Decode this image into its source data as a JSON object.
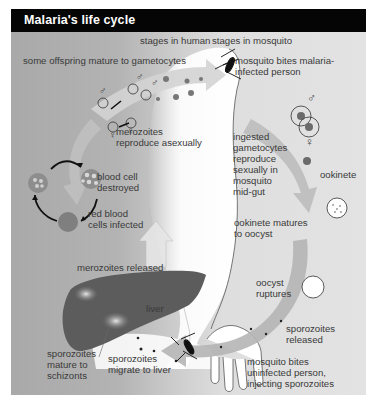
{
  "title": "Malaria's life cycle",
  "sections": {
    "human": "stages in human",
    "mosquito": "stages in mosquito"
  },
  "human_stages": {
    "gametocytes": "some offspring mature to gametocytes",
    "merozoites_reproduce": "merozoites\nreproduce asexually",
    "blood_cell_destroyed": "blood cell\ndestroyed",
    "red_blood_cells_infected": "red blood\ncells infected",
    "merozoites_released": "merozoites released",
    "liver": "liver",
    "sporozoites_mature": "sporozoites\nmature to\nschizonts",
    "sporozoites_migrate": "sporozoites\nmigrate to liver"
  },
  "mosquito_stages": {
    "bites_infected": "mosquito bites malaria-\ninfected person",
    "ingested_gametocytes": "ingested\ngametocytes\nreproduce\nsexually in\nmosquito\nmid-gut",
    "ookinete": "ookinete",
    "ookinete_matures": "ookinete matures\nto oocyst",
    "oocyst_ruptures": "oocyst\nruptures",
    "sporozoites_released": "sporozoites\nreleased",
    "bites_uninfected": "mosquito bites\nuninfected person,\ninjecting sporozoites"
  },
  "symbols": {
    "male": "♂",
    "female": "♀"
  },
  "colors": {
    "header_bg": "#050505",
    "header_text": "#ffffff",
    "panel_left": "#a9a9a9",
    "panel_right": "#e2e2e2",
    "liver": "#5e5e5e",
    "arrow": "#c8c8c8",
    "text": "#3a3a3a"
  }
}
